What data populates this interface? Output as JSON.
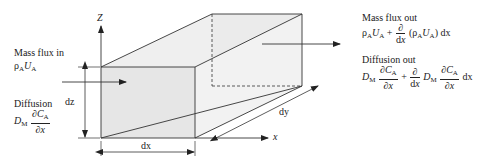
{
  "left": {
    "mass_flux_in": {
      "title": "Mass flux in",
      "expr": "ρAUA"
    },
    "diffusion": {
      "title": "Diffusion",
      "coef": "D",
      "coef_sub": "M",
      "num": "∂C",
      "num_sub": "A",
      "den": "∂x"
    }
  },
  "right": {
    "mass_flux_out": {
      "title": "Mass flux out",
      "term1": "ρAUA",
      "plus": "+",
      "deriv_num": "∂",
      "deriv_den": "dx",
      "term2": "(ρAUA) dx"
    },
    "diffusion_out": {
      "title": "Diffusion out",
      "coef": "D",
      "coef_sub": "M",
      "num": "∂C",
      "num_sub": "A",
      "den": "∂x",
      "plus": "+",
      "deriv_num": "∂",
      "deriv_den": "dx",
      "trail": "dx"
    }
  },
  "axes": {
    "z": "Z",
    "x": "x"
  },
  "dimensions": {
    "dx": "dx",
    "dy": "dy",
    "dz": "dz"
  },
  "colors": {
    "face_fill": "#ececec",
    "line": "#333333"
  }
}
